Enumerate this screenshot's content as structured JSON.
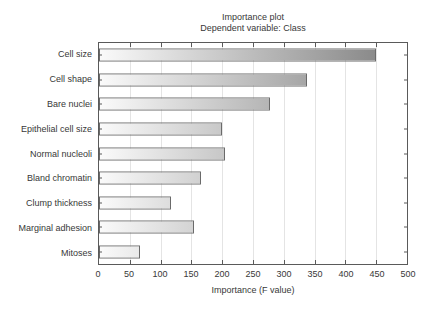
{
  "chart_data": {
    "type": "bar",
    "orientation": "horizontal",
    "title": "Importance plot",
    "subtitle": "Dependent variable: Class",
    "xlabel": "Importance (F value)",
    "categories": [
      "Cell size",
      "Cell shape",
      "Bare nuclei",
      "Epithelial cell size",
      "Normal nucleoli",
      "Bland chromatin",
      "Clump thickness",
      "Marginal adhesion",
      "Mitoses"
    ],
    "values": [
      449,
      337,
      277,
      199,
      205,
      166,
      117,
      155,
      67
    ],
    "xlim": [
      0,
      500
    ],
    "xticks": [
      0,
      50,
      100,
      150,
      200,
      250,
      300,
      350,
      400,
      450,
      500
    ],
    "grid": "vertical-gridlines-every-50",
    "legend": "none",
    "colors": {
      "background": "#ffffff",
      "text": "#383838",
      "plot_border": "#5a5a5a",
      "gridline": "#e4e4e4",
      "tick": "#5a5a5a",
      "bar_border": "#6a6a6a",
      "bar_gradient_start": "#fafafa",
      "bar_gradient_end": "#7e7e7e"
    }
  }
}
